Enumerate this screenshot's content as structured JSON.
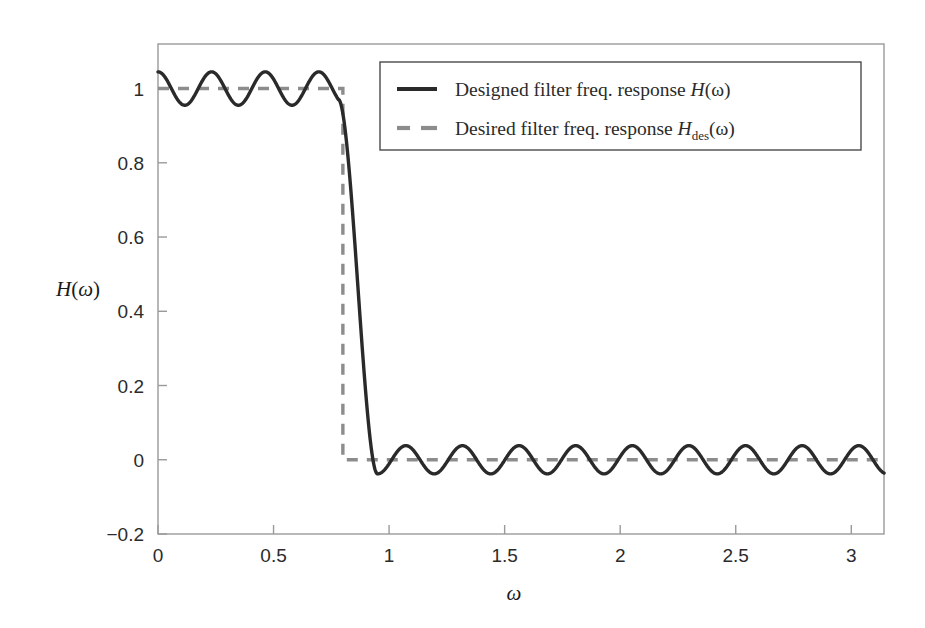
{
  "chart_data": {
    "type": "line",
    "title": "",
    "xlabel": "ω",
    "ylabel": "H(ω)",
    "xlim": [
      0,
      3.14159
    ],
    "ylim": [
      -0.2,
      1.12
    ],
    "grid": false,
    "xticks": [
      0,
      0.5,
      1,
      1.5,
      2,
      2.5,
      3
    ],
    "xticklabels": [
      "0",
      "0.5",
      "1",
      "1.5",
      "2",
      "2.5",
      "3"
    ],
    "yticks": [
      -0.2,
      0,
      0.2,
      0.4,
      0.6,
      0.8,
      1
    ],
    "yticklabels": [
      "−0.2",
      "0",
      "0.2",
      "0.4",
      "0.6",
      "0.8",
      "1"
    ],
    "legend_position": "upper right",
    "series": [
      {
        "name": "Designed filter freq. response H(ω)",
        "style": "solid",
        "color": "#2a2a2a",
        "linewidth": 3.2,
        "description": "Equiripple lowpass FIR magnitude response: passband ripple about 1.0 of amplitude 0.045 for omega < 0.78, steep transition band from 0.78 to 0.95, stopband ripple about 0.0 of amplitude 0.038 for omega > 0.95",
        "passband_edge": 0.78,
        "stopband_edge": 0.95,
        "passband_ripple": 0.045,
        "stopband_ripple": 0.038,
        "passband_ripple_period": 0.232,
        "stopband_ripple_period": 0.245
      },
      {
        "name": "Desired filter freq. response H_des(ω)",
        "style": "dashed",
        "color": "#8c8c8c",
        "linewidth": 3.2,
        "description": "Ideal brick-wall lowpass: value 1 for omega < 0.8, value 0 for omega > 0.8",
        "cutoff": 0.8,
        "passband_value": 1,
        "stopband_value": 0
      }
    ]
  },
  "axes": {
    "y_axis_title": "H(ω)",
    "x_axis_title": "ω"
  },
  "legend": {
    "entries": [
      {
        "marker": "solid-line-swatch",
        "prefix": "Designed filter freq. response ",
        "symbol": "H",
        "subscript": "",
        "suffix": "(ω)"
      },
      {
        "marker": "dashed-line-swatch",
        "prefix": "Desired filter freq. response ",
        "symbol": "H",
        "subscript": "des",
        "suffix": "(ω)"
      }
    ]
  },
  "style": {
    "designed_color": "#2a2a2a",
    "desired_color": "#8c8c8c",
    "frame_color": "#9a9a9a",
    "background": "#ffffff"
  }
}
